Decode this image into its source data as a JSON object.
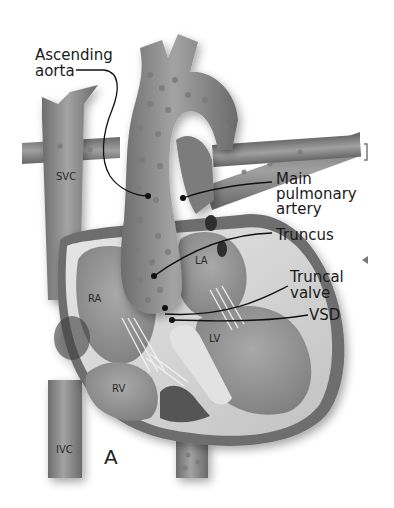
{
  "figure": {
    "panel_label": "A",
    "style": "grayscale anatomical illustration"
  },
  "callouts": [
    {
      "id": "ascending-aorta",
      "lines": [
        "Ascending",
        "aorta"
      ]
    },
    {
      "id": "main-pulmonary-artery",
      "lines": [
        "Main",
        "pulmonary",
        "artery"
      ]
    },
    {
      "id": "truncus",
      "lines": [
        "Truncus"
      ]
    },
    {
      "id": "truncal-valve",
      "lines": [
        "Truncal",
        "valve"
      ]
    },
    {
      "id": "vsd",
      "lines": [
        "VSD"
      ]
    }
  ],
  "structure_labels": {
    "svc": "SVC",
    "ivc": "IVC",
    "ra": "RA",
    "la": "LA",
    "rv": "RV",
    "lv": "LV"
  },
  "colors": {
    "background": "#ffffff",
    "vessel": "#8c8c8c",
    "vessel_dark": "#5e5e5e",
    "chamber": "#9a9a9a",
    "myocardium": "#d4d4d4",
    "text": "#1a1a1a"
  }
}
